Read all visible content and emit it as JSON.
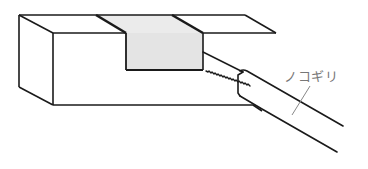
{
  "diagram": {
    "labels": {
      "saw": "ノコギリ"
    },
    "colors": {
      "line": "#1a1a1a",
      "groove_fill": "#e6e6e6",
      "label": "#777777",
      "leader": "#888888"
    }
  }
}
